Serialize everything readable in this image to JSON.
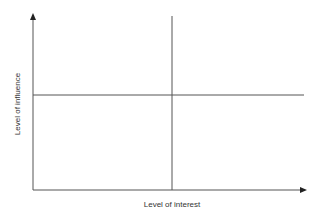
{
  "diagram": {
    "type": "quadrant-matrix",
    "x_axis_label": "Level of interest",
    "y_axis_label": "Level of influence",
    "colors": {
      "axis": "#555555",
      "divider": "#555555",
      "text": "#333333",
      "background": "#ffffff"
    }
  }
}
